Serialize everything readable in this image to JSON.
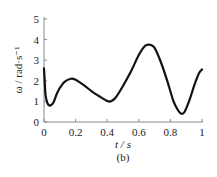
{
  "chart_data": {
    "type": "line",
    "title": "",
    "caption": "(b)",
    "xlabel": "t / s",
    "ylabel": "ω / rad·s⁻¹",
    "xlim": [
      0,
      1
    ],
    "ylim": [
      0,
      5
    ],
    "xticks": [
      0,
      0.2,
      0.4,
      0.6,
      0.8,
      1
    ],
    "xtick_labels": [
      "0",
      "0.2",
      "0.4",
      "0.6",
      "0.8",
      "1"
    ],
    "yticks": [
      0,
      1,
      2,
      3,
      4,
      5
    ],
    "ytick_labels": [
      "0",
      "1",
      "2",
      "3",
      "4",
      "5"
    ],
    "grid": false,
    "legend": null,
    "series": [
      {
        "name": "ω",
        "color": "#111111",
        "x": [
          0,
          0.005,
          0.01,
          0.02,
          0.03,
          0.04,
          0.06,
          0.08,
          0.1,
          0.13,
          0.17,
          0.2,
          0.25,
          0.3,
          0.35,
          0.4,
          0.42,
          0.45,
          0.5,
          0.55,
          0.6,
          0.64,
          0.67,
          0.7,
          0.74,
          0.78,
          0.82,
          0.85,
          0.87,
          0.89,
          0.92,
          0.95,
          0.98,
          1.0
        ],
        "values": [
          2.6,
          1.9,
          1.3,
          0.95,
          0.82,
          0.8,
          0.95,
          1.35,
          1.65,
          1.95,
          2.1,
          2.05,
          1.8,
          1.5,
          1.25,
          1.02,
          1.0,
          1.15,
          1.75,
          2.45,
          3.25,
          3.7,
          3.75,
          3.6,
          2.9,
          2.0,
          1.0,
          0.55,
          0.4,
          0.5,
          1.05,
          1.75,
          2.35,
          2.55
        ]
      }
    ]
  },
  "labels": {
    "xlabel": "t / s",
    "ylabel": "ω / rad·s⁻¹",
    "caption": "(b)"
  }
}
